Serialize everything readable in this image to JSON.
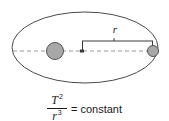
{
  "figure": {
    "background_color": "#ffffff"
  },
  "diagram": {
    "orbit": {
      "name": "elliptical orbit path",
      "stroke_color": "#4a4a4a",
      "cx": 85,
      "cy": 47.5,
      "rx": 73,
      "ry": 35.5
    },
    "major_axis": {
      "name": "major axis dashed line",
      "stroke_color": "#9a9a9a",
      "y": 51,
      "x_start": 13,
      "x_end": 155,
      "dash": "4,3"
    },
    "star": {
      "name": "central star",
      "cx": 55,
      "cy": 51,
      "r": 8.5,
      "fill_color": "#a8a8a8",
      "stroke_color": "#555555"
    },
    "planet": {
      "name": "orbiting planet",
      "cx": 153,
      "cy": 51,
      "r": 5.5,
      "fill_color": "#a8a8a8",
      "stroke_color": "#555555"
    },
    "radius_measure": {
      "label": "r",
      "stroke_color": "#3a3a3a",
      "bracket_y": 41,
      "x_start": 82,
      "x_end": 153,
      "axis_y": 51
    }
  },
  "equation": {
    "numerator_symbol": "T",
    "numerator_exponent": "2",
    "denominator_symbol": "r",
    "denominator_exponent": "3",
    "equals_sign": "=",
    "right_side": "constant"
  }
}
